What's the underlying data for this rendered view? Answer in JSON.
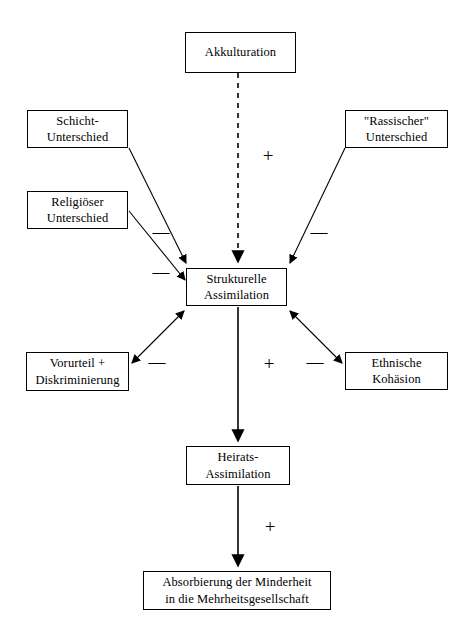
{
  "diagram": {
    "background_color": "#ffffff",
    "line_color": "#000000",
    "nodes": [
      {
        "id": "akkulturation",
        "line1": "Akkulturation",
        "line2": ""
      },
      {
        "id": "schicht",
        "line1": "Schicht-",
        "line2": "Unterschied"
      },
      {
        "id": "rassischer",
        "line1": "\"Rassischer\"",
        "line2": "Unterschied"
      },
      {
        "id": "religioeser",
        "line1": "Religiöser",
        "line2": "Unterschied"
      },
      {
        "id": "strukturelle",
        "line1": "Strukturelle",
        "line2": "Assimilation"
      },
      {
        "id": "vorurteil",
        "line1": "Vorurteil +",
        "line2": "Diskriminierung"
      },
      {
        "id": "ethnische",
        "line1": "Ethnische",
        "line2": "Kohäsion"
      },
      {
        "id": "heirats",
        "line1": "Heirats-",
        "line2": "Assimilation"
      },
      {
        "id": "absorbierung",
        "line1": "Absorbierung der Minderheit",
        "line2": "in die Mehrheitsgesellschaft"
      }
    ],
    "signs": {
      "akkulturation_to_strukturelle": "+",
      "schicht_to_strukturelle": "—",
      "religioeser_to_strukturelle": "—",
      "rassischer_to_strukturelle": "—",
      "vorurteil_strukturelle": "—",
      "ethnische_strukturelle": "—",
      "strukturelle_to_heirats": "+",
      "heirats_to_absorbierung": "+"
    },
    "edges": [
      {
        "id": "akkulturation-strukturelle",
        "from": "akkulturation",
        "to": "strukturelle",
        "style": "dashed",
        "heads": 1,
        "sign": "+"
      },
      {
        "id": "schicht-strukturelle",
        "from": "schicht",
        "to": "strukturelle",
        "style": "solid",
        "heads": 1,
        "sign": "—"
      },
      {
        "id": "religioeser-strukturelle",
        "from": "religioeser",
        "to": "strukturelle",
        "style": "solid",
        "heads": 1,
        "sign": "—"
      },
      {
        "id": "rassischer-strukturelle",
        "from": "rassischer",
        "to": "strukturelle",
        "style": "solid",
        "heads": 1,
        "sign": "—"
      },
      {
        "id": "vorurteil-strukturelle",
        "from": "vorurteil",
        "to": "strukturelle",
        "style": "solid",
        "heads": 2,
        "sign": "—"
      },
      {
        "id": "ethnische-strukturelle",
        "from": "strukturelle",
        "to": "ethnische",
        "style": "solid",
        "heads": 2,
        "sign": "—"
      },
      {
        "id": "strukturelle-heirats",
        "from": "strukturelle",
        "to": "heirats",
        "style": "solid",
        "heads": 1,
        "sign": "+"
      },
      {
        "id": "heirats-absorbierung",
        "from": "heirats",
        "to": "absorbierung",
        "style": "solid",
        "heads": 1,
        "sign": "+"
      }
    ]
  }
}
